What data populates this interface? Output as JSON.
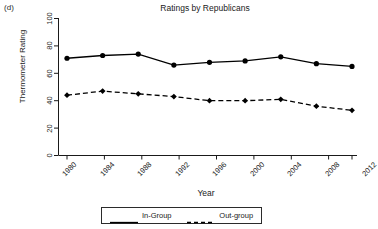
{
  "panel": {
    "label": "(d)"
  },
  "chart_data": {
    "type": "line",
    "title": "Ratings by Republicans",
    "xlabel": "Year",
    "ylabel": "Thermometer Rating",
    "x": [
      1980,
      1984,
      1988,
      1992,
      1996,
      2000,
      2004,
      2008,
      2012
    ],
    "categories": [
      "1980",
      "1984",
      "1988",
      "1992",
      "1996",
      "2000",
      "2004",
      "2008",
      "2012"
    ],
    "series": [
      {
        "name": "In-Group",
        "values": [
          71,
          73,
          74,
          66,
          68,
          69,
          72,
          67,
          65
        ],
        "linestyle": "solid",
        "marker": "filled-circle",
        "color": "#000000"
      },
      {
        "name": "Out-group",
        "values": [
          44,
          47,
          45,
          43,
          40,
          40,
          41,
          36,
          33
        ],
        "linestyle": "dashed",
        "marker": "filled-diamond",
        "color": "#000000"
      }
    ],
    "ylim": [
      0,
      100
    ],
    "yticks": [
      0,
      20,
      40,
      60,
      80,
      100
    ],
    "ytick_labels": [
      "0",
      "20",
      "40",
      "60",
      "80",
      "100"
    ],
    "xlim": [
      1980,
      2012
    ],
    "xticks": [
      1980,
      1984,
      1988,
      1992,
      1996,
      2000,
      2004,
      2008,
      2012
    ],
    "grid": false,
    "legend_position": "below-axis",
    "frame": "left-and-bottom-only"
  },
  "legend": {
    "entries": [
      {
        "label": "In-Group",
        "style": "solid"
      },
      {
        "label": "Out-group",
        "style": "dashed"
      }
    ]
  },
  "colors": {
    "ink": "#1a1a1a",
    "line": "#000000",
    "background": "#ffffff"
  }
}
